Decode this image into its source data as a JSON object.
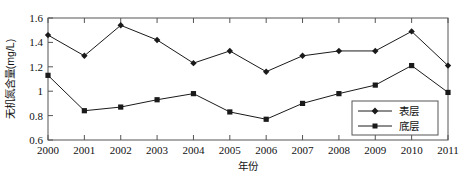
{
  "chart_data": {
    "type": "line",
    "title": "",
    "xlabel": "年份",
    "ylabel": "无机氮含量(mg/L)",
    "categories": [
      "2000",
      "2001",
      "2002",
      "2003",
      "2004",
      "2005",
      "2006",
      "2007",
      "2008",
      "2009",
      "2010",
      "2011"
    ],
    "x_tick_labels": [
      "2000",
      "2001",
      "2002",
      "2003",
      "2004",
      "2005",
      "2006",
      "2007",
      "2008",
      "2009",
      "2010",
      "2011"
    ],
    "y_tick_labels": [
      "0.6",
      "0.8",
      "1",
      "1.2",
      "1.4",
      "1.6"
    ],
    "y_tick_values": [
      0.6,
      0.8,
      1.0,
      1.2,
      1.4,
      1.6
    ],
    "ylim": [
      0.6,
      1.6
    ],
    "xlim": [
      2000,
      2011
    ],
    "grid": false,
    "legend_position": "bottom-right",
    "series": [
      {
        "name": "表层",
        "marker": "diamond",
        "color": "#1a1a1a",
        "values": [
          1.46,
          1.29,
          1.54,
          1.42,
          1.23,
          1.33,
          1.16,
          1.29,
          1.33,
          1.33,
          1.49,
          1.21
        ]
      },
      {
        "name": "底层",
        "marker": "square",
        "color": "#1a1a1a",
        "values": [
          1.13,
          0.84,
          0.87,
          0.93,
          0.98,
          0.83,
          0.77,
          0.9,
          0.98,
          1.05,
          1.21,
          0.99
        ]
      }
    ]
  },
  "legend": {
    "items": [
      {
        "label": "表层"
      },
      {
        "label": "底层"
      }
    ]
  },
  "axes": {
    "x_title": "年份",
    "y_title": "无机氮含量(mg/L)"
  }
}
